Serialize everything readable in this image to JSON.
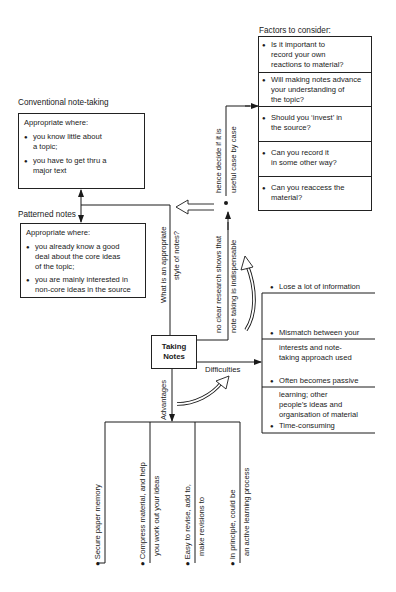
{
  "center": {
    "title_line1": "Taking",
    "title_line2": "Notes"
  },
  "factors": {
    "heading": "Factors to consider:",
    "items": [
      {
        "lines": [
          "Is it important to",
          "record your own",
          "reactions to material?"
        ]
      },
      {
        "lines": [
          "Will making notes advance",
          "your understanding of",
          "the topic?"
        ]
      },
      {
        "lines": [
          "Should you ‘invest’ in",
          "the source?"
        ]
      },
      {
        "lines": [
          "Can you record it",
          "in some other way?"
        ]
      },
      {
        "lines": [
          "Can you reaccess the",
          "material?"
        ]
      }
    ]
  },
  "conventional": {
    "heading": "Conventional note-taking",
    "intro": "Appropriate where:",
    "items": [
      {
        "lines": [
          "you know little about",
          "a topic;"
        ]
      },
      {
        "lines": [
          "you have to get thru a",
          "major text"
        ]
      }
    ]
  },
  "patterned": {
    "heading": "Patterned notes",
    "intro": "Appropriate where:",
    "items": [
      {
        "lines": [
          "you already know a good",
          "deal about the core ideas",
          "of the topic;"
        ]
      },
      {
        "lines": [
          "you are mainly interested in",
          "non-core ideas in the source"
        ]
      }
    ]
  },
  "branches": {
    "style_question": {
      "line1": "What is an appropriate",
      "line2": "style of notes?"
    },
    "research": {
      "line1": "no clear research shows that",
      "line2": "note taking is indispensable"
    },
    "decide": {
      "line1": "hence decide if it is",
      "line2": "useful case by case"
    },
    "difficulties_label": "Difficulties",
    "advantages_label": "Advantages"
  },
  "difficulties": {
    "items": [
      {
        "first": "Lose a lot of information",
        "rest": []
      },
      {
        "first": "Mismatch between your",
        "rest": [
          "interests and note-",
          "taking approach used"
        ]
      },
      {
        "first": "Often becomes passive",
        "rest": [
          "learning; other",
          "people’s ideas and",
          "organisation of material"
        ]
      },
      {
        "first": "Time-consuming",
        "rest": []
      }
    ]
  },
  "advantages": {
    "items": [
      {
        "first": "Secure paper memory",
        "second": ""
      },
      {
        "first": "Compress material, and help",
        "second": "you work out your ideas"
      },
      {
        "first": "Easy to revise, add to,",
        "second": "make revisions to"
      },
      {
        "first": "In principle, could be",
        "second": "an active learning process"
      }
    ]
  },
  "colors": {
    "ink": "#1a1a1a",
    "background": "#ffffff"
  }
}
